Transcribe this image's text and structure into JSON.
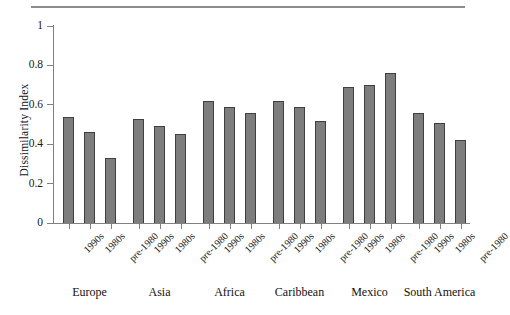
{
  "figure": {
    "has_top_rule": true,
    "background_color": "#ffffff",
    "axis_color": "#808080",
    "bar_fill_color": "#7d7d7d",
    "bar_edge_color": "#3f3f3f"
  },
  "chart_data": {
    "type": "bar",
    "title": "",
    "xlabel": "",
    "ylabel": "Dissimilarity Index",
    "ylim": [
      0,
      1
    ],
    "yticks": [
      "0",
      "0.2",
      "0.4",
      "0.6",
      "0.8",
      "1"
    ],
    "ytick_values": [
      0,
      0.2,
      0.4,
      0.6,
      0.8,
      1
    ],
    "grid": false,
    "legend": "none",
    "categories": [
      "Europe",
      "Asia",
      "Africa",
      "Caribbean",
      "Mexico",
      "South America"
    ],
    "period_labels": [
      "1990s",
      "1980s",
      "pre-1980"
    ],
    "series": [
      {
        "name": "1990s",
        "values": [
          0.54,
          0.53,
          0.62,
          0.62,
          0.69,
          0.56
        ]
      },
      {
        "name": "1980s",
        "values": [
          0.46,
          0.49,
          0.59,
          0.59,
          0.7,
          0.51
        ]
      },
      {
        "name": "pre-1980",
        "values": [
          0.33,
          0.45,
          0.56,
          0.52,
          0.76,
          0.42
        ]
      }
    ],
    "groups": [
      {
        "label": "Europe",
        "bars": [
          {
            "period": "1990s",
            "value": 0.54
          },
          {
            "period": "1980s",
            "value": 0.46
          },
          {
            "period": "pre-1980",
            "value": 0.33
          }
        ]
      },
      {
        "label": "Asia",
        "bars": [
          {
            "period": "1990s",
            "value": 0.53
          },
          {
            "period": "1980s",
            "value": 0.49
          },
          {
            "period": "pre-1980",
            "value": 0.45
          }
        ]
      },
      {
        "label": "Africa",
        "bars": [
          {
            "period": "1990s",
            "value": 0.62
          },
          {
            "period": "1980s",
            "value": 0.59
          },
          {
            "period": "pre-1980",
            "value": 0.56
          }
        ]
      },
      {
        "label": "Caribbean",
        "bars": [
          {
            "period": "1990s",
            "value": 0.62
          },
          {
            "period": "1980s",
            "value": 0.59
          },
          {
            "period": "pre-1980",
            "value": 0.52
          }
        ]
      },
      {
        "label": "Mexico",
        "bars": [
          {
            "period": "1990s",
            "value": 0.69
          },
          {
            "period": "1980s",
            "value": 0.7
          },
          {
            "period": "pre-1980",
            "value": 0.76
          }
        ]
      },
      {
        "label": "South America",
        "bars": [
          {
            "period": "1990s",
            "value": 0.56
          },
          {
            "period": "1980s",
            "value": 0.51
          },
          {
            "period": "pre-1980",
            "value": 0.42
          }
        ]
      }
    ]
  }
}
